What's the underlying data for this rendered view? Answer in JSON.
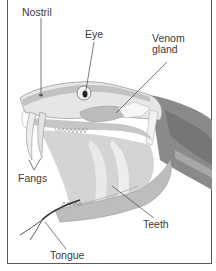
{
  "diagram": {
    "labels": {
      "nostril": "Nostril",
      "eye": "Eye",
      "venom_gland_line1": "Venom",
      "venom_gland_line2": "gland",
      "fangs": "Fangs",
      "teeth": "Teeth",
      "tongue": "Tongue"
    },
    "colors": {
      "frame": "#5a5a5a",
      "leader_line": "#444444",
      "head_light": "#d9d9d9",
      "head_mid": "#b5b5b5",
      "body_dark": "#7d7d7d",
      "mouth_inner": "#c8c8c8",
      "label_text": "#3a3a3a"
    }
  }
}
